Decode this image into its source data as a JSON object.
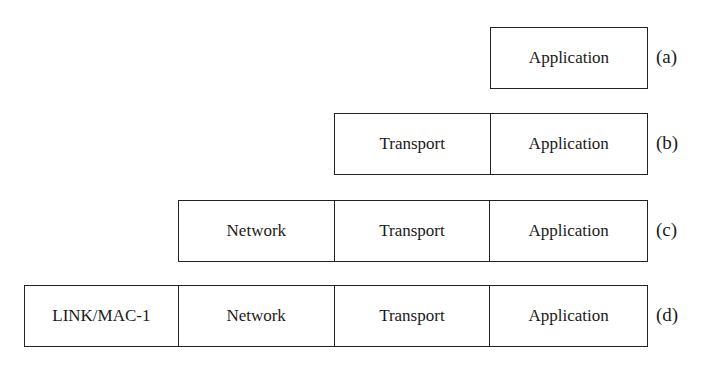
{
  "diagram": {
    "rows": [
      {
        "id": "a",
        "label": "(a)",
        "layers": [
          "Application"
        ]
      },
      {
        "id": "b",
        "label": "(b)",
        "layers": [
          "Transport",
          "Application"
        ]
      },
      {
        "id": "c",
        "label": "(c)",
        "layers": [
          "Network",
          "Transport",
          "Application"
        ]
      },
      {
        "id": "d",
        "label": "(d)",
        "layers": [
          "LINK/MAC-1",
          "Network",
          "Transport",
          "Application"
        ]
      }
    ]
  }
}
